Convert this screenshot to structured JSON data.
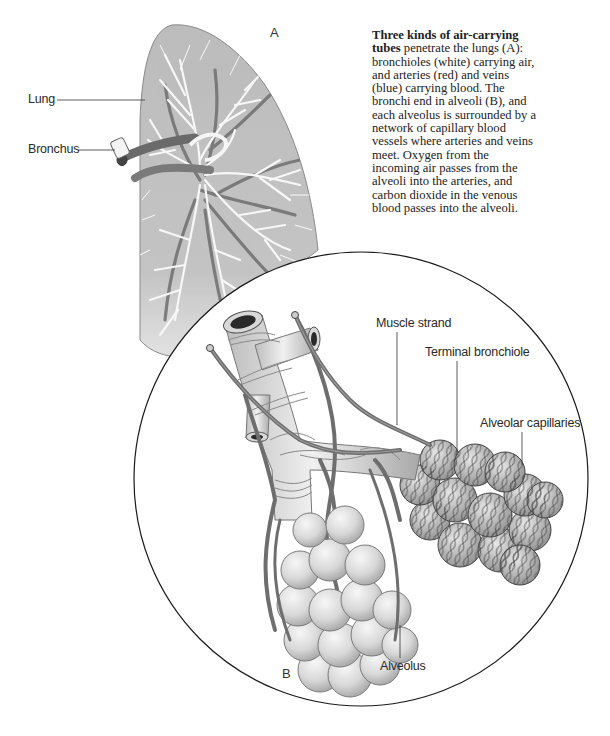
{
  "figure": {
    "panel_a_label": "A",
    "panel_b_label": "B",
    "labels": {
      "lung": "Lung",
      "bronchus": "Bronchus",
      "muscle_strand": "Muscle strand",
      "terminal_bronchiole": "Terminal bronchiole",
      "alveolar_capillaries": "Alveolar capillaries",
      "alveolus": "Alveolus"
    },
    "caption": {
      "bold_lead": "Three kinds of air-carrying",
      "bold_lead_2": "tubes",
      "lines": [
        " penetrate the lungs (A):",
        "bronchioles (white) carrying air,",
        "and arteries (red) and veins",
        "(blue) carrying blood. The",
        "bronchi end in alveoli (B), and",
        "each alveolus is surrounded by a",
        "network of capillary blood",
        "vessels where arteries and veins",
        "meet. Oxygen from the",
        "incoming air passes from the",
        "alveoli into the arteries, and",
        "carbon dioxide in the venous",
        "blood passes into the alveoli."
      ]
    },
    "colors": {
      "lung_fill": "#bdbdbd",
      "bronchiole_white": "#f4f4f4",
      "vessel_dark": "#6e6e6e",
      "alveolus_fill": "#dcdcdc",
      "capillary_net": "#555555",
      "outline": "#1a1a1a"
    }
  }
}
